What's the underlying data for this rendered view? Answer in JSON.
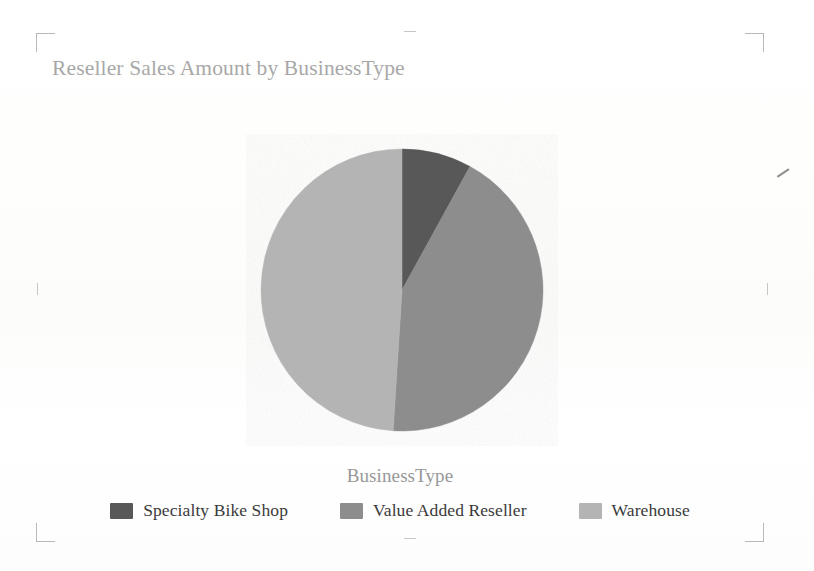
{
  "document": {
    "background_color": "#fdfdfc",
    "crop_marks": [
      "top-left",
      "top-right",
      "bottom-left",
      "bottom-right"
    ],
    "edge_ticks": [
      "left",
      "right",
      "top",
      "bottom"
    ]
  },
  "chart": {
    "title": "Reseller Sales Amount by BusinessType",
    "title_color": "#a8a8a8",
    "category_title": "BusinessType",
    "category_title_color": "#989898",
    "legend_position": "bottom"
  },
  "legend": {
    "items": [
      {
        "label": "Specialty Bike Shop",
        "color": "#585858"
      },
      {
        "label": "Value Added Reseller",
        "color": "#8d8d8d"
      },
      {
        "label": "Warehouse",
        "color": "#b4b4b4"
      }
    ]
  },
  "chart_data": {
    "type": "pie",
    "title": "Reseller Sales Amount by BusinessType",
    "xlabel": "BusinessType",
    "ylabel": "Reseller Sales Amount",
    "categories": [
      "Specialty Bike Shop",
      "Value Added Reseller",
      "Warehouse"
    ],
    "values": [
      8,
      43,
      49
    ],
    "value_unit": "percent",
    "colors": [
      "#585858",
      "#8d8d8d",
      "#b4b4b4"
    ],
    "start_angle_deg": 0,
    "direction": "clockwise",
    "grid": false,
    "legend": "bottom",
    "slices": [
      {
        "label": "Specialty Bike Shop",
        "percent": 8,
        "start_deg": 0,
        "end_deg": 28.8,
        "color": "#585858"
      },
      {
        "label": "Value Added Reseller",
        "percent": 43,
        "start_deg": 28.8,
        "end_deg": 183.6,
        "color": "#8d8d8d"
      },
      {
        "label": "Warehouse",
        "percent": 49,
        "start_deg": 183.6,
        "end_deg": 360,
        "color": "#b4b4b4"
      }
    ]
  }
}
